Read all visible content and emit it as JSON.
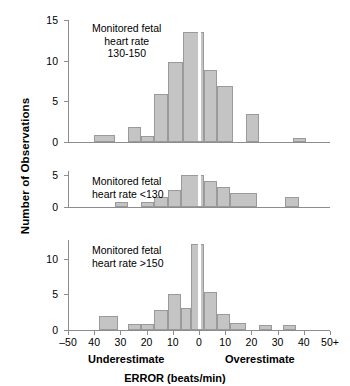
{
  "chart_data": {
    "type": "bar",
    "title": "ERROR (beats/min)",
    "xlabel": "ERROR (beats/min)",
    "ylabel": "Number of Observations",
    "xlim": [
      -50,
      50
    ],
    "x_tick_values": [
      -50,
      -40,
      -30,
      -20,
      -10,
      0,
      10,
      20,
      30,
      40,
      50
    ],
    "x_tick_labels": [
      "–50",
      "40",
      "30",
      "20",
      "10",
      "0",
      "10",
      "20",
      "30",
      "40",
      "50+"
    ],
    "bin_width": 5,
    "grid": false,
    "legend": false,
    "side_labels": {
      "left": "Underestimate",
      "right": "Overestimate"
    },
    "panels": [
      {
        "id": "panel-130-150",
        "annotation": [
          "Monitored fetal",
          "heart rate",
          "130-150"
        ],
        "ylim": [
          0,
          15
        ],
        "y_ticks": [
          0,
          5,
          10,
          15
        ],
        "bins": [
          {
            "x0": -40,
            "x1": -32,
            "value": 0.8
          },
          {
            "x0": -27,
            "x1": -22,
            "value": 1.9
          },
          {
            "x0": -22,
            "x1": -17,
            "value": 0.7
          },
          {
            "x0": -17,
            "x1": -12,
            "value": 5.9
          },
          {
            "x0": -12,
            "x1": -6,
            "value": 9.8
          },
          {
            "x0": -6,
            "x1": 2,
            "value": 13.5
          },
          {
            "x0": 2,
            "x1": 7,
            "value": 8.8
          },
          {
            "x0": 7,
            "x1": 13,
            "value": 6.9
          },
          {
            "x0": 18,
            "x1": 23,
            "value": 3.5
          },
          {
            "x0": 36,
            "x1": 41,
            "value": 0.5
          }
        ]
      },
      {
        "id": "panel-lt-130",
        "annotation": [
          "Monitored fetal",
          "heart rate <130"
        ],
        "ylim": [
          0,
          5.6
        ],
        "y_ticks": [
          0,
          5
        ],
        "bins": [
          {
            "x0": -32,
            "x1": -27,
            "value": 0.8
          },
          {
            "x0": -22,
            "x1": -17,
            "value": 0.8
          },
          {
            "x0": -17,
            "x1": -12,
            "value": 1.5
          },
          {
            "x0": -12,
            "x1": -7,
            "value": 2.6
          },
          {
            "x0": -7,
            "x1": 2,
            "value": 5.0
          },
          {
            "x0": 2,
            "x1": 7,
            "value": 4.0
          },
          {
            "x0": 7,
            "x1": 12,
            "value": 3.1
          },
          {
            "x0": 12,
            "x1": 22,
            "value": 2.2
          },
          {
            "x0": 33,
            "x1": 38,
            "value": 1.5
          }
        ]
      },
      {
        "id": "panel-gt-150",
        "annotation": [
          "Monitored fetal",
          "heart rate >150"
        ],
        "ylim": [
          0,
          12.6
        ],
        "y_ticks": [
          0,
          5,
          10
        ],
        "bins": [
          {
            "x0": -38,
            "x1": -31,
            "value": 2.0
          },
          {
            "x0": -27,
            "x1": -22,
            "value": 0.8
          },
          {
            "x0": -22,
            "x1": -17,
            "value": 0.8
          },
          {
            "x0": -17,
            "x1": -12,
            "value": 2.8
          },
          {
            "x0": -12,
            "x1": -7,
            "value": 5.0
          },
          {
            "x0": -7,
            "x1": -3,
            "value": 3.1
          },
          {
            "x0": -3,
            "x1": 2,
            "value": 12.0
          },
          {
            "x0": 2,
            "x1": 7,
            "value": 5.3
          },
          {
            "x0": 7,
            "x1": 12,
            "value": 2.2
          },
          {
            "x0": 12,
            "x1": 18,
            "value": 1.0
          },
          {
            "x0": 23,
            "x1": 28,
            "value": 0.7
          },
          {
            "x0": 32,
            "x1": 37,
            "value": 0.7
          }
        ]
      }
    ]
  }
}
